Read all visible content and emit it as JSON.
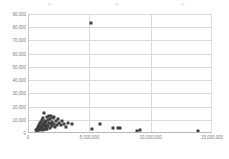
{
  "chart_data": {
    "type": "scatter",
    "title": "",
    "subtitle": "",
    "xlabel": "",
    "ylabel": "",
    "xlim": [
      0,
      15000000
    ],
    "ylim": [
      0,
      90000
    ],
    "grid": "horizontal-and-vertical",
    "legend": "none",
    "marker_color": "#3f3f3f",
    "gridline_color": "#d9d9d9",
    "background_color": "#ffffff",
    "x_ticks": [
      {
        "value": 0,
        "label": "0"
      },
      {
        "value": 5000000,
        "label": "5,000,000"
      },
      {
        "value": 10000000,
        "label": "10,000,000"
      },
      {
        "value": 15000000,
        "label": "15,000,000"
      }
    ],
    "y_ticks": [
      {
        "value": 0,
        "label": "0"
      },
      {
        "value": 10000,
        "label": "10,000"
      },
      {
        "value": 20000,
        "label": "20,000"
      },
      {
        "value": 30000,
        "label": "30,000"
      },
      {
        "value": 40000,
        "label": "40,000"
      },
      {
        "value": 50000,
        "label": "50,000"
      },
      {
        "value": 60000,
        "label": "60,000"
      },
      {
        "value": 70000,
        "label": "70,000"
      },
      {
        "value": 80000,
        "label": "80,000"
      },
      {
        "value": 90000,
        "label": "90,000"
      }
    ],
    "points": [
      [
        5150000,
        83000
      ],
      [
        620000,
        2100
      ],
      [
        700000,
        3000
      ],
      [
        760000,
        1800
      ],
      [
        800000,
        4200
      ],
      [
        840000,
        2600
      ],
      [
        880000,
        6100
      ],
      [
        900000,
        3400
      ],
      [
        930000,
        5200
      ],
      [
        960000,
        2200
      ],
      [
        990000,
        7300
      ],
      [
        1010000,
        4000
      ],
      [
        1040000,
        8600
      ],
      [
        1060000,
        2900
      ],
      [
        1090000,
        5600
      ],
      [
        1110000,
        3600
      ],
      [
        1140000,
        9800
      ],
      [
        1160000,
        4700
      ],
      [
        1190000,
        6800
      ],
      [
        1210000,
        2400
      ],
      [
        1240000,
        11200
      ],
      [
        1270000,
        5000
      ],
      [
        1300000,
        15400
      ],
      [
        1320000,
        7600
      ],
      [
        1350000,
        3200
      ],
      [
        1380000,
        9200
      ],
      [
        1400000,
        5900
      ],
      [
        1430000,
        2700
      ],
      [
        1460000,
        8100
      ],
      [
        1490000,
        4400
      ],
      [
        1520000,
        11800
      ],
      [
        1550000,
        6400
      ],
      [
        1580000,
        3100
      ],
      [
        1610000,
        9600
      ],
      [
        1650000,
        5400
      ],
      [
        1690000,
        12600
      ],
      [
        1720000,
        7900
      ],
      [
        1760000,
        4100
      ],
      [
        1800000,
        10400
      ],
      [
        1840000,
        6600
      ],
      [
        1880000,
        12900
      ],
      [
        1930000,
        8400
      ],
      [
        1980000,
        5100
      ],
      [
        2030000,
        11000
      ],
      [
        2090000,
        7100
      ],
      [
        2150000,
        12400
      ],
      [
        2220000,
        4600
      ],
      [
        2300000,
        8900
      ],
      [
        2380000,
        6200
      ],
      [
        2460000,
        10600
      ],
      [
        2560000,
        7400
      ],
      [
        2680000,
        5700
      ],
      [
        2800000,
        9100
      ],
      [
        2940000,
        6900
      ],
      [
        3080000,
        4900
      ],
      [
        3250000,
        7700
      ],
      [
        3560000,
        6700
      ],
      [
        5230000,
        3300
      ],
      [
        5880000,
        7100
      ],
      [
        6940000,
        3900
      ],
      [
        7370000,
        3700
      ],
      [
        7490000,
        3500
      ],
      [
        8860000,
        1600
      ],
      [
        9120000,
        1900
      ],
      [
        13880000,
        1800
      ]
    ]
  },
  "crop_marks": [
    {
      "x": 46,
      "glyph": "+"
    },
    {
      "x": 113,
      "glyph": "+"
    },
    {
      "x": 179,
      "glyph": "+"
    }
  ]
}
